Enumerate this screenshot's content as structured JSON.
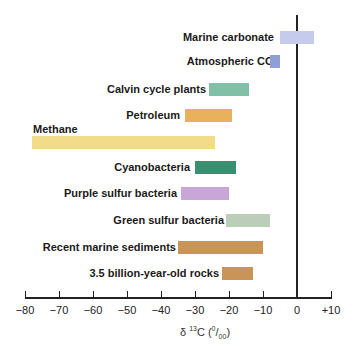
{
  "chart_data": {
    "type": "bar",
    "orientation": "horizontal-range",
    "title": "",
    "xlabel": "δ 13C (0/00)",
    "xlabel_parts": {
      "delta": "δ ",
      "sup": "13",
      "main": "C (",
      "num": "0",
      "slash": "/",
      "den": "00",
      "close": ")"
    },
    "ylabel": "",
    "xlim": [
      -80,
      10
    ],
    "x_ticks": [
      -80,
      -70,
      -60,
      -50,
      -40,
      -30,
      -20,
      -10,
      0,
      10
    ],
    "x_tick_labels": [
      "−80",
      "−70",
      "−60",
      "−50",
      "−40",
      "−30",
      "−20",
      "−10",
      "0",
      "+10"
    ],
    "grid": false,
    "zero_line": true,
    "series": [
      {
        "name": "Marine carbonate",
        "min": -5,
        "max": 5,
        "color": "#c5cbea"
      },
      {
        "name": "Atmospheric CO2",
        "min": -8,
        "max": -5,
        "color": "#8e9fd3"
      },
      {
        "name": "Calvin cycle plants",
        "min": -26,
        "max": -14,
        "color": "#7fc0a6"
      },
      {
        "name": "Petroleum",
        "min": -33,
        "max": -19,
        "color": "#e9b15a"
      },
      {
        "name": "Methane",
        "min": -78,
        "max": -24,
        "color": "#f2dc8a"
      },
      {
        "name": "Cyanobacteria",
        "min": -30,
        "max": -18,
        "color": "#3a8f70"
      },
      {
        "name": "Purple sulfur bacteria",
        "min": -34,
        "max": -20,
        "color": "#c9a6d8"
      },
      {
        "name": "Green sulfur bacteria",
        "min": -21,
        "max": -8,
        "color": "#bccdba"
      },
      {
        "name": "Recent marine sediments",
        "min": -35,
        "max": -10,
        "color": "#c99457"
      },
      {
        "name": "3.5 billion-year-old rocks",
        "min": -22,
        "max": -13,
        "color": "#c99457"
      }
    ]
  },
  "labels": {
    "marine_carbonate": "Marine carbonate",
    "atmospheric_co2_main": "Atmospheric CO",
    "atmospheric_co2_sub": "2",
    "calvin": "Calvin cycle plants",
    "petroleum": "Petroleum",
    "methane": "Methane",
    "cyanobacteria": "Cyanobacteria",
    "purple": "Purple sulfur bacteria",
    "green": "Green sulfur bacteria",
    "recent": "Recent marine sediments",
    "rocks": "3.5 billion-year-old rocks"
  }
}
